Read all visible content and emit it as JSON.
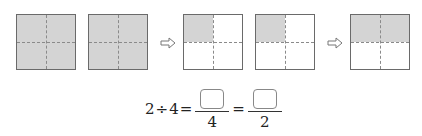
{
  "figure": {
    "squares": [
      {
        "left": 16,
        "shaded": [
          true,
          true,
          true,
          true
        ]
      },
      {
        "left": 88,
        "shaded": [
          true,
          true,
          true,
          true
        ]
      },
      {
        "left": 183,
        "shaded": [
          true,
          false,
          false,
          false
        ]
      },
      {
        "left": 255,
        "shaded": [
          true,
          false,
          false,
          false
        ]
      },
      {
        "left": 350,
        "shaded": [
          true,
          true,
          false,
          false
        ]
      }
    ],
    "arrows": [
      "right-arrow",
      "right-arrow"
    ],
    "colors": {
      "shade": "#d4d4d4",
      "border": "#6a6a6a",
      "dash": "#8a8a8a"
    }
  },
  "equation": {
    "dividend": "2",
    "op": "÷",
    "divisor": "4",
    "eq1": "=",
    "frac1_den": "4",
    "eq2": "=",
    "frac2_den": "2"
  }
}
